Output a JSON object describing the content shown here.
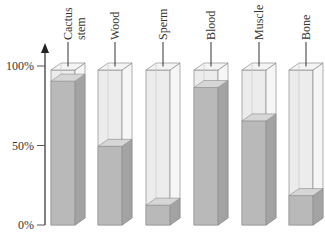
{
  "chart_data": {
    "type": "bar",
    "title": "",
    "xlabel": "",
    "ylabel": "",
    "ylim": [
      0,
      100
    ],
    "yticks": [
      "0%",
      "50%",
      "100%"
    ],
    "categories": [
      "Cactus stem",
      "Wood",
      "Sperm",
      "Blood",
      "Muscle",
      "Bone"
    ],
    "category_lines": [
      [
        "Cactus",
        "stem"
      ],
      [
        "Wood"
      ],
      [
        "Sperm"
      ],
      [
        "Blood"
      ],
      [
        "Muscle"
      ],
      [
        "Bone"
      ]
    ],
    "series": [
      {
        "name": "Water content",
        "values": [
          93,
          52,
          15,
          89,
          68,
          21
        ]
      }
    ],
    "grid": false,
    "legend": "none",
    "style": "3D translucent columns, gray fill"
  },
  "colors": {
    "fill_front": "#b9b9b9",
    "fill_side": "#a3a3a3",
    "fill_top": "#d6d6d6",
    "glass_front": "#ececec",
    "glass_side": "#f6f6f6",
    "edge": "#8c8c8c",
    "axis": "#555555"
  }
}
